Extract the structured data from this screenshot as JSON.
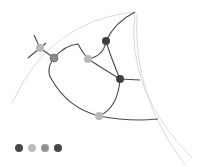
{
  "diagram": {
    "title": "",
    "colors": {
      "edge": "#4a4a4a",
      "arc": "#d4d4d4",
      "node_dark": "#3f3f3f",
      "node_medium": "#8c8c8c",
      "node_light": "#b8b8b8"
    },
    "legend": [
      {
        "color": "#474747"
      },
      {
        "color": "#bdbdbd"
      },
      {
        "color": "#8f8f8f"
      },
      {
        "color": "#474747"
      }
    ]
  }
}
